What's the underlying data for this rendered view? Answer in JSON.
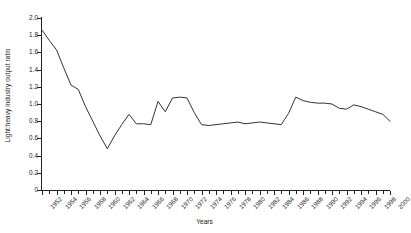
{
  "chart_data": {
    "type": "line",
    "title": "",
    "xlabel": "Years",
    "ylabel": "Light:heavy industry output ratio",
    "xlim": [
      1952,
      2000
    ],
    "ylim": [
      0,
      2.0
    ],
    "grid": false,
    "legend": "none",
    "y_ticks": [
      "0",
      "0.2",
      "0.4",
      "0.6",
      "0.8",
      "1.0",
      "1.2",
      "1.4",
      "1.6",
      "1.8",
      "2.0"
    ],
    "y_tick_values": [
      0,
      0.2,
      0.4,
      0.6,
      0.8,
      1.0,
      1.2,
      1.4,
      1.6,
      1.8,
      2.0
    ],
    "x_tick_labels": [
      "1952",
      "1954",
      "1956",
      "1958",
      "1960",
      "1962",
      "1964",
      "1966",
      "1968",
      "1970",
      "1972",
      "1974",
      "1976",
      "1978",
      "1980",
      "1982",
      "1984",
      "1986",
      "1988",
      "1990",
      "1992",
      "1994",
      "1996",
      "1998",
      "2000"
    ],
    "x_tick_values": [
      1952,
      1954,
      1956,
      1958,
      1960,
      1962,
      1964,
      1966,
      1968,
      1970,
      1972,
      1974,
      1976,
      1978,
      1980,
      1982,
      1984,
      1986,
      1988,
      1990,
      1992,
      1994,
      1996,
      1998,
      2000
    ],
    "line_color": "#333333",
    "x": [
      1952,
      1953,
      1954,
      1955,
      1956,
      1957,
      1958,
      1959,
      1960,
      1961,
      1962,
      1963,
      1964,
      1965,
      1966,
      1967,
      1968,
      1969,
      1970,
      1971,
      1972,
      1973,
      1974,
      1975,
      1976,
      1977,
      1978,
      1979,
      1980,
      1981,
      1982,
      1983,
      1984,
      1985,
      1986,
      1987,
      1988,
      1989,
      1990,
      1991,
      1992,
      1993,
      1994,
      1995,
      1996,
      1997,
      1998,
      1999,
      2000
    ],
    "values": [
      1.86,
      1.74,
      1.63,
      1.42,
      1.22,
      1.17,
      0.97,
      0.8,
      0.63,
      0.48,
      0.63,
      0.76,
      0.88,
      0.77,
      0.77,
      0.76,
      1.03,
      0.91,
      1.07,
      1.08,
      1.07,
      0.9,
      0.76,
      0.75,
      0.76,
      0.77,
      0.78,
      0.79,
      0.77,
      0.78,
      0.79,
      0.78,
      0.77,
      0.76,
      0.89,
      1.08,
      1.04,
      1.02,
      1.01,
      1.01,
      1.0,
      0.95,
      0.94,
      0.99,
      0.97,
      0.94,
      0.91,
      0.88,
      0.8
    ],
    "series": [
      {
        "name": "Light:heavy industry output ratio",
        "points": [
          {
            "year": 1952,
            "value": 1.86
          },
          {
            "year": 1953,
            "value": 1.74
          },
          {
            "year": 1954,
            "value": 1.63
          },
          {
            "year": 1955,
            "value": 1.42
          },
          {
            "year": 1956,
            "value": 1.22
          },
          {
            "year": 1957,
            "value": 1.17
          },
          {
            "year": 1958,
            "value": 0.97
          },
          {
            "year": 1959,
            "value": 0.8
          },
          {
            "year": 1960,
            "value": 0.63
          },
          {
            "year": 1961,
            "value": 0.48
          },
          {
            "year": 1962,
            "value": 0.63
          },
          {
            "year": 1963,
            "value": 0.76
          },
          {
            "year": 1964,
            "value": 0.88
          },
          {
            "year": 1965,
            "value": 0.77
          },
          {
            "year": 1966,
            "value": 0.77
          },
          {
            "year": 1967,
            "value": 0.76
          },
          {
            "year": 1968,
            "value": 1.03
          },
          {
            "year": 1969,
            "value": 0.91
          },
          {
            "year": 1970,
            "value": 1.07
          },
          {
            "year": 1971,
            "value": 1.08
          },
          {
            "year": 1972,
            "value": 1.07
          },
          {
            "year": 1973,
            "value": 0.9
          },
          {
            "year": 1974,
            "value": 0.76
          },
          {
            "year": 1975,
            "value": 0.75
          },
          {
            "year": 1976,
            "value": 0.76
          },
          {
            "year": 1977,
            "value": 0.77
          },
          {
            "year": 1978,
            "value": 0.78
          },
          {
            "year": 1979,
            "value": 0.79
          },
          {
            "year": 1980,
            "value": 0.77
          },
          {
            "year": 1981,
            "value": 0.78
          },
          {
            "year": 1982,
            "value": 0.79
          },
          {
            "year": 1983,
            "value": 0.78
          },
          {
            "year": 1984,
            "value": 0.77
          },
          {
            "year": 1985,
            "value": 0.76
          },
          {
            "year": 1986,
            "value": 0.89
          },
          {
            "year": 1987,
            "value": 1.08
          },
          {
            "year": 1988,
            "value": 1.04
          },
          {
            "year": 1989,
            "value": 1.02
          },
          {
            "year": 1990,
            "value": 1.01
          },
          {
            "year": 1991,
            "value": 1.01
          },
          {
            "year": 1992,
            "value": 1.0
          },
          {
            "year": 1993,
            "value": 0.95
          },
          {
            "year": 1994,
            "value": 0.94
          },
          {
            "year": 1995,
            "value": 0.99
          },
          {
            "year": 1996,
            "value": 0.97
          },
          {
            "year": 1997,
            "value": 0.94
          },
          {
            "year": 1998,
            "value": 0.91
          },
          {
            "year": 1999,
            "value": 0.88
          },
          {
            "year": 2000,
            "value": 0.8
          }
        ]
      }
    ]
  }
}
